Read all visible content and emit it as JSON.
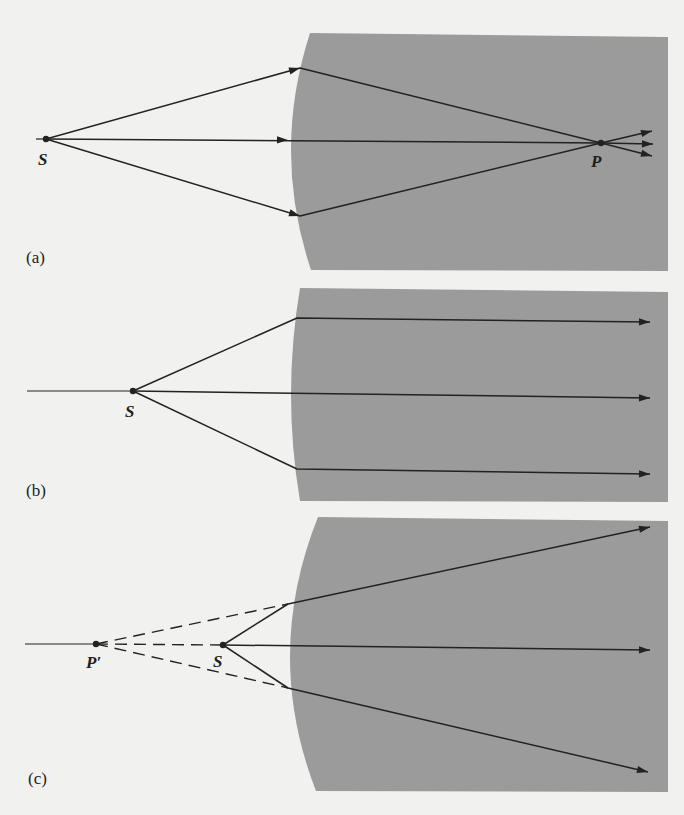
{
  "figure": {
    "title": "",
    "background_color": "#f1f1ef",
    "medium_color": "#9b9b9b",
    "ray_color": "#222222"
  },
  "panels": [
    {
      "id": "a",
      "label": "(a)",
      "label_pos": [
        26,
        248
      ],
      "medium": {
        "x_left_top": 310,
        "x_left_mid": 291,
        "x_left_bottom": 311,
        "x_right": 668,
        "y_top": 33,
        "y_bottom": 271
      },
      "axis": {
        "x1": 36,
        "x2": 46,
        "y": 139
      },
      "points": [
        {
          "name": "S",
          "x": 46,
          "y": 139,
          "label": "S",
          "label_pos": [
            38,
            150
          ]
        },
        {
          "name": "P",
          "x": 601,
          "y": 143,
          "label": "P",
          "label_pos": [
            591,
            152
          ]
        }
      ],
      "rays": [
        {
          "kind": "solid",
          "path": [
            [
              46,
              139
            ],
            [
              300,
              68
            ],
            [
              601,
              143
            ],
            [
              652,
              131
            ]
          ],
          "arrows": [
            [
              300,
              68,
              "in"
            ],
            [
              652,
              131,
              "end"
            ]
          ]
        },
        {
          "kind": "solid",
          "path": [
            [
              46,
              139
            ],
            [
              601,
              143
            ],
            [
              653,
              144
            ]
          ],
          "arrows": [
            [
              288,
              140,
              "mid"
            ],
            [
              653,
              144,
              "end"
            ]
          ]
        },
        {
          "kind": "solid",
          "path": [
            [
              46,
              139
            ],
            [
              300,
              216
            ],
            [
              601,
              143
            ],
            [
              652,
              156
            ]
          ],
          "arrows": [
            [
              300,
              216,
              "in"
            ],
            [
              652,
              156,
              "end"
            ]
          ]
        }
      ]
    },
    {
      "id": "b",
      "label": "(b)",
      "label_pos": [
        26,
        481
      ],
      "medium": {
        "x_left_top": 300,
        "x_left_mid": 291,
        "x_left_bottom": 300,
        "x_right": 668,
        "y_top": 288,
        "y_bottom": 502
      },
      "axis": {
        "x1": 27,
        "x2": 133,
        "y": 391
      },
      "points": [
        {
          "name": "S",
          "x": 133,
          "y": 391,
          "label": "S",
          "label_pos": [
            125,
            402
          ]
        }
      ],
      "rays": [
        {
          "kind": "solid",
          "path": [
            [
              133,
              391
            ],
            [
              297,
              318
            ],
            [
              650,
              322
            ]
          ],
          "arrows": [
            [
              650,
              322,
              "end"
            ]
          ]
        },
        {
          "kind": "solid",
          "path": [
            [
              133,
              391
            ],
            [
              650,
              398
            ]
          ],
          "arrows": [
            [
              650,
              398,
              "end"
            ]
          ]
        },
        {
          "kind": "solid",
          "path": [
            [
              133,
              391
            ],
            [
              297,
              469
            ],
            [
              650,
              474
            ]
          ],
          "arrows": [
            [
              650,
              474,
              "end"
            ]
          ]
        }
      ]
    },
    {
      "id": "c",
      "label": "(c)",
      "label_pos": [
        28,
        769
      ],
      "medium": {
        "x_left_top": 318,
        "x_left_mid": 290,
        "x_left_bottom": 316,
        "x_right": 668,
        "y_top": 517,
        "y_bottom": 792
      },
      "axis": {
        "x1": 25,
        "x2": 96,
        "y": 644
      },
      "points": [
        {
          "name": "P'",
          "x": 96,
          "y": 644,
          "label": "P′",
          "label_pos": [
            86,
            653
          ]
        },
        {
          "name": "S",
          "x": 223,
          "y": 645,
          "label": "S",
          "label_pos": [
            213,
            652
          ]
        }
      ],
      "rays": [
        {
          "kind": "dashed",
          "path": [
            [
              96,
              644
            ],
            [
              288,
              604
            ]
          ]
        },
        {
          "kind": "dashed",
          "path": [
            [
              96,
              644
            ],
            [
              223,
              645
            ]
          ]
        },
        {
          "kind": "dashed",
          "path": [
            [
              96,
              644
            ],
            [
              288,
              688
            ]
          ]
        },
        {
          "kind": "solid",
          "path": [
            [
              223,
              645
            ],
            [
              288,
              604
            ],
            [
              650,
              527
            ]
          ],
          "arrows": [
            [
              650,
              527,
              "end"
            ]
          ]
        },
        {
          "kind": "solid",
          "path": [
            [
              223,
              645
            ],
            [
              650,
              650
            ]
          ],
          "arrows": [
            [
              650,
              650,
              "end"
            ]
          ]
        },
        {
          "kind": "solid",
          "path": [
            [
              223,
              645
            ],
            [
              288,
              688
            ],
            [
              648,
              772
            ]
          ],
          "arrows": [
            [
              648,
              772,
              "end"
            ]
          ]
        }
      ]
    }
  ]
}
